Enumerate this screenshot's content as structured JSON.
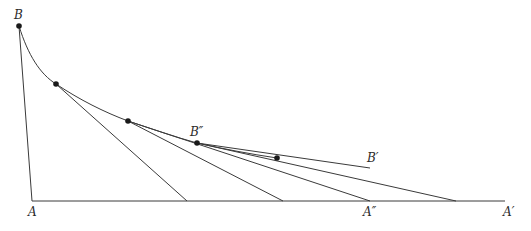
{
  "diagram": {
    "labels": {
      "B": "B",
      "A": "A",
      "B_double_prime": "B″",
      "B_prime": "B′",
      "A_double_prime": "A″",
      "A_prime": "A′"
    },
    "colors": {
      "line": "#3a3a3a",
      "point": "#1a1a1a",
      "background": "#ffffff"
    },
    "points": [
      {
        "name": "B",
        "x": 19,
        "y": 26
      },
      {
        "name": "P1",
        "x": 56,
        "y": 84
      },
      {
        "name": "P2",
        "x": 128,
        "y": 121
      },
      {
        "name": "B''",
        "x": 197,
        "y": 143
      },
      {
        "name": "P4",
        "x": 277,
        "y": 158
      }
    ],
    "baseline": {
      "x1": 32,
      "y": 201,
      "x2": 505
    },
    "tangent_ends": [
      187,
      283,
      370,
      456
    ],
    "b_prime_end": {
      "x": 370,
      "y": 168
    }
  }
}
